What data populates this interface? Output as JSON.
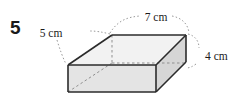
{
  "problem": {
    "number": "5"
  },
  "figure": {
    "type": "rectangular-prism",
    "projection": "oblique",
    "labels": {
      "depth": "5 cm",
      "length": "7 cm",
      "height": "4 cm"
    },
    "colors": {
      "top_face": "#f2f2f2",
      "front_face": "#e4e4e4",
      "right_face": "#d6d6d6",
      "visible_edge": "#2b2b2b",
      "hidden_edge": "#8f8f8f",
      "leader_line": "#9a9a9a",
      "text": "#1a1a1a"
    },
    "dimensions": {
      "depth_cm": 5,
      "length_cm": 7,
      "height_cm": 4
    }
  }
}
